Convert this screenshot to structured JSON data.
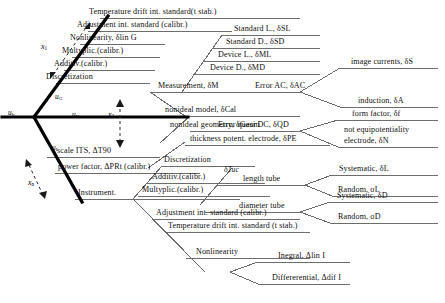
{
  "diagram": {
    "type": "ishikawa-fishbone",
    "title": "",
    "spine_labels": [
      {
        "id": "u_b",
        "text": "u",
        "sub": "b"
      },
      {
        "id": "u_G",
        "text": "u",
        "sub": "G"
      },
      {
        "id": "u_K",
        "text": "u",
        "sub": "K"
      },
      {
        "id": "u_I",
        "text": "u",
        "sub": "I"
      }
    ],
    "variable_labels": [
      {
        "id": "x_1",
        "text": "x",
        "sub": "1"
      },
      {
        "id": "x_2",
        "text": "x",
        "sub": "2"
      },
      {
        "id": "x_n",
        "text": "x",
        "sub": "n"
      }
    ],
    "branches": {
      "upper_left": [
        "Temperature drift int. standard(t stab.)",
        "Adjustment int. standard (calibr.)",
        "Nonlinearity, δlin G",
        "Multyplic.(calibr.)",
        "Additiv.(calibr.)",
        "Discretization"
      ],
      "measurement_group": {
        "label": "Measurement, δM",
        "items": [
          "Standard L., δSL",
          "Standard D., δSD",
          "Device L., δML",
          "Device D., δMD"
        ]
      },
      "model_group": {
        "nonideal_model": "nonideal model, δCal",
        "nonideal_geometry": "nonideal geometry, δGeom",
        "error_ac": {
          "label": "Error AC, δAC",
          "items": [
            "image currents, δS",
            "induction, δA"
          ]
        },
        "error_quasi_dc": {
          "label": "Error quasi DC, δQD",
          "items": [
            "form factor, δf",
            "not equipotentiality",
            "electrode, δN"
          ]
        },
        "thickness": "thickness potent. electrode, δPE"
      },
      "lower_left": [
        "scale ITS, ΔT90",
        "power factor, ΔPRt (calibr.)",
        "Instrument."
      ],
      "tube_group": {
        "label": "δTuc",
        "length_tube": {
          "label": "length  tube",
          "items": [
            "Systematic, δL",
            "Random, σL"
          ]
        },
        "diameter_tube": {
          "label": "diameter tube",
          "items": [
            "Systematic, δD",
            "Random, σD"
          ]
        }
      },
      "instrument_group": [
        "Discretization",
        "Additiv.(calibr.)",
        "Multyplic.(calibr.)",
        "Adjustment int. standard (calibr.)",
        "Temperature drift int. standard (t stab.)"
      ],
      "nonlinearity_group": {
        "label": "Nonlinearity",
        "items": [
          "Inegral, Δlin I",
          "Differerential, Δdif I"
        ]
      }
    },
    "colors": {
      "line": "#6d6d6d",
      "spine": "#000000",
      "text": "#101010",
      "background": "#ffffff"
    }
  }
}
